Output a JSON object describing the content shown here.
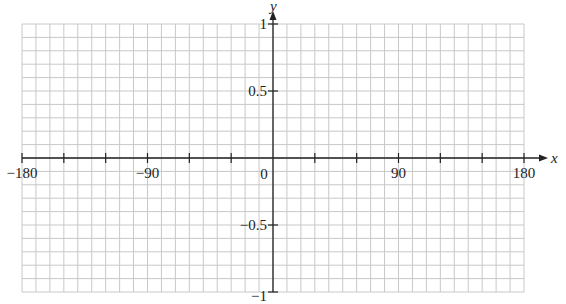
{
  "chart_data": {
    "type": "line",
    "title": "",
    "xlabel": "x",
    "ylabel": "y",
    "xlim": [
      -180,
      180
    ],
    "ylim": [
      -1,
      1
    ],
    "grid": true,
    "grid_x_step": 10,
    "grid_y_step": 0.1,
    "x_ticks": [
      -180,
      -150,
      -120,
      -90,
      -60,
      -30,
      0,
      30,
      60,
      90,
      120,
      150,
      180
    ],
    "x_tick_labels": [
      {
        "value": -180,
        "label": "−180"
      },
      {
        "value": -90,
        "label": "−90"
      },
      {
        "value": 0,
        "label": "0"
      },
      {
        "value": 90,
        "label": "90"
      },
      {
        "value": 180,
        "label": "180"
      }
    ],
    "y_ticks": [
      -1,
      -0.5,
      0.5,
      1
    ],
    "y_tick_labels": [
      {
        "value": 1,
        "label": "1"
      },
      {
        "value": 0.5,
        "label": "0.5"
      },
      {
        "value": -0.5,
        "label": "−0.5"
      },
      {
        "value": -1,
        "label": "−1"
      }
    ],
    "series": []
  },
  "colors": {
    "grid": "#c8c8c8",
    "axis": "#222222"
  }
}
